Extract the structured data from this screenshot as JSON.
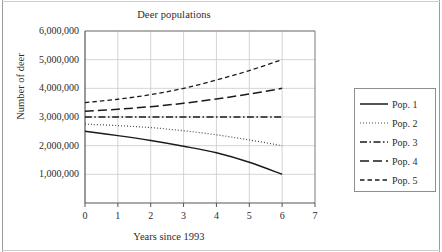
{
  "chart_data": {
    "type": "line",
    "title": "Deer populations",
    "xlabel": "Years since 1993",
    "ylabel": "Number of deer",
    "xlim": [
      0,
      7
    ],
    "ylim": [
      0,
      6000000
    ],
    "grid": true,
    "legend_position": "right-outside",
    "xticks": [
      0,
      1,
      2,
      3,
      4,
      5,
      6,
      7
    ],
    "xtick_labels": [
      "0",
      "1",
      "2",
      "3",
      "4",
      "5",
      "6",
      "7"
    ],
    "yticks": [
      1000000,
      2000000,
      3000000,
      4000000,
      5000000,
      6000000
    ],
    "ytick_labels": [
      "1,000,000",
      "2,000,000",
      "3,000,000",
      "4,000,000",
      "5,000,000",
      "6,000,000"
    ],
    "x": [
      0,
      1,
      2,
      3,
      4,
      5,
      6
    ],
    "series": [
      {
        "name": "Pop. 1",
        "style": "solid",
        "color": "#1a1a1a",
        "values": [
          2500000,
          2350000,
          2180000,
          1980000,
          1750000,
          1420000,
          1000000
        ]
      },
      {
        "name": "Pop. 2",
        "style": "dotted",
        "color": "#4a4a4a",
        "values": [
          2750000,
          2700000,
          2630000,
          2520000,
          2380000,
          2200000,
          2000000
        ]
      },
      {
        "name": "Pop. 3",
        "style": "dashdot",
        "color": "#1a1a1a",
        "values": [
          3000000,
          3000000,
          3000000,
          3000000,
          3000000,
          3000000,
          3000000
        ]
      },
      {
        "name": "Pop. 4",
        "style": "longdash",
        "color": "#1a1a1a",
        "values": [
          3200000,
          3270000,
          3360000,
          3480000,
          3630000,
          3800000,
          4000000
        ]
      },
      {
        "name": "Pop. 5",
        "style": "shortdash",
        "color": "#1a1a1a",
        "values": [
          3500000,
          3620000,
          3780000,
          4000000,
          4290000,
          4620000,
          5000000
        ]
      }
    ]
  },
  "legend": {
    "items": [
      {
        "label": "Pop. 1"
      },
      {
        "label": "Pop. 2"
      },
      {
        "label": "Pop. 3"
      },
      {
        "label": "Pop. 4"
      },
      {
        "label": "Pop. 5"
      }
    ]
  }
}
